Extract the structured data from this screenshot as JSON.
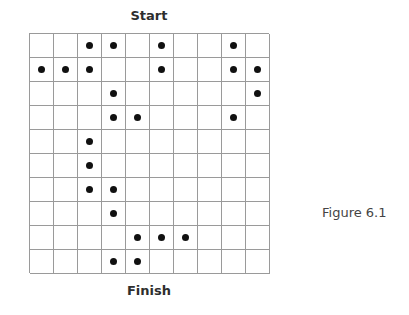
{
  "figure": {
    "start_label": "Start",
    "finish_label": "Finish",
    "caption": "Figure 6.1",
    "grid": {
      "rows": 10,
      "cols": 10,
      "dots": [
        [
          2,
          3,
          5,
          8
        ],
        [
          0,
          1,
          2,
          5,
          8,
          9
        ],
        [
          3,
          9
        ],
        [
          3,
          4,
          8
        ],
        [
          2
        ],
        [
          2
        ],
        [
          2,
          3
        ],
        [
          3
        ],
        [
          4,
          5,
          6
        ],
        [
          3,
          4
        ]
      ]
    },
    "colors": {
      "grid_line": "#9a9a9a",
      "dot": "#111111"
    }
  }
}
